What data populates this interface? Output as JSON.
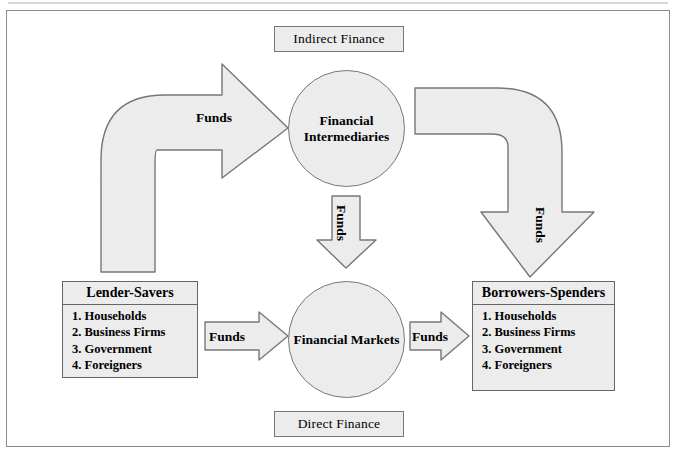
{
  "diagram": {
    "colors": {
      "shape_fill": "#ececec",
      "shape_outline": "#777777",
      "frame_outline": "#8c8c8c",
      "text": "#000000",
      "page_background": "#ffffff"
    },
    "top_label": "Indirect Finance",
    "bottom_label": "Direct Finance",
    "nodes": {
      "financial_intermediaries": "Financial Intermediaries",
      "financial_markets": "Financial Markets",
      "lender_savers": {
        "title": "Lender-Savers",
        "items": [
          "1. Households",
          "2. Business Firms",
          "3. Government",
          "4. Foreigners"
        ]
      },
      "borrowers_spenders": {
        "title": "Borrowers-Spenders",
        "items": [
          "1. Households",
          "2. Business Firms",
          "3. Government",
          "4. Foreigners"
        ]
      }
    },
    "flows": {
      "lender_to_intermediaries": "Funds",
      "intermediaries_to_markets": "Funds",
      "intermediaries_to_borrowers": "Funds",
      "lender_to_markets": "Funds",
      "markets_to_borrowers": "Funds"
    }
  }
}
